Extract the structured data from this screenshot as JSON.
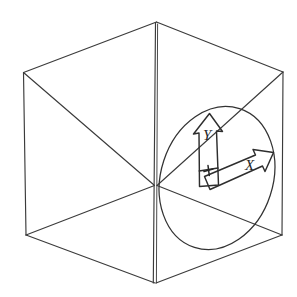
{
  "figure": {
    "background_color": "#ffffff",
    "line_color": "#3b3b3b",
    "width": 297,
    "height": 297,
    "style": "line-drawing"
  },
  "cube": {
    "name": "cube",
    "description": "Transparent wireframe cube drawn in two-point perspective, front vertical edge nearest viewer",
    "vertices": {
      "top_apex": [
        156,
        22
      ],
      "top_left": [
        23,
        72
      ],
      "top_right": [
        283,
        72
      ],
      "center_front_top": [
        155,
        185
      ],
      "bottom_left": [
        26,
        235
      ],
      "bottom_right": [
        282,
        235
      ],
      "bottom_apex": [
        155,
        283
      ]
    },
    "edge_count": 9,
    "visible_faces": [
      "top",
      "left",
      "right"
    ]
  },
  "ellipse": {
    "name": "circle-in-perspective",
    "description": "Circle drawn on the right face of the cube, appearing as a tilted ellipse",
    "center": [
      217,
      178
    ],
    "radius_x": 56,
    "radius_y": 73,
    "rotation_deg": 18
  },
  "axes": {
    "origin_label": "+",
    "origin_point": [
      211,
      178
    ],
    "items": [
      {
        "name": "y-axis-arrow",
        "label": "Y",
        "direction": "up",
        "label_position": [
          209,
          135
        ],
        "style": "hollow-outlined-arrow"
      },
      {
        "name": "x-axis-arrow",
        "label": "X",
        "direction": "up-right-diagonal",
        "label_position": [
          252,
          165
        ],
        "style": "hollow-outlined-arrow"
      }
    ]
  }
}
